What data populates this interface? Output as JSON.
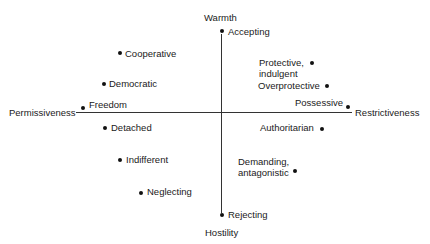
{
  "axes": {
    "top": "Warmth",
    "bottom": "Hostility",
    "left": "Permissiveness",
    "right": "Restrictiveness"
  },
  "points": [
    {
      "label": "Accepting"
    },
    {
      "label": "Cooperative"
    },
    {
      "label": "Democratic"
    },
    {
      "label": "Freedom"
    },
    {
      "label": "Detached"
    },
    {
      "label": "Indifferent"
    },
    {
      "label": "Neglecting"
    },
    {
      "label": "Rejecting"
    },
    {
      "label": "Protective,\nindulgent"
    },
    {
      "label": "Overprotective"
    },
    {
      "label": "Possessive"
    },
    {
      "label": "Authoritarian"
    },
    {
      "label": "Demanding,\nantagonistic"
    }
  ]
}
